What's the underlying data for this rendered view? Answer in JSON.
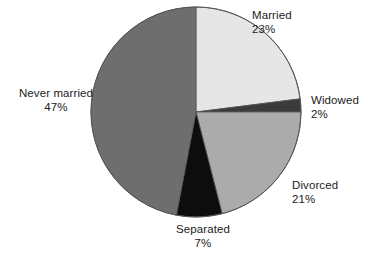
{
  "chart_data": {
    "type": "pie",
    "title": "",
    "subtitle": "",
    "xlabel": "",
    "ylabel": "",
    "legend_position": "none",
    "grid": false,
    "labels_outside": true,
    "start_angle_deg": 0,
    "direction": "clockwise",
    "categories": [
      "Married",
      "Widowed",
      "Divorced",
      "Separated",
      "Never married"
    ],
    "values": [
      23,
      2,
      21,
      7,
      47
    ],
    "unit": "%",
    "total": 100,
    "slices": [
      {
        "name": "Married",
        "value": 23,
        "value_text": "23%",
        "color": "#e6e6e6",
        "start_deg": 0,
        "end_deg": 82.8
      },
      {
        "name": "Widowed",
        "value": 2,
        "value_text": "2%",
        "color": "#3b3b3b",
        "start_deg": 82.8,
        "end_deg": 90.0
      },
      {
        "name": "Divorced",
        "value": 21,
        "value_text": "21%",
        "color": "#ababab",
        "start_deg": 90.0,
        "end_deg": 165.6
      },
      {
        "name": "Separated",
        "value": 7,
        "value_text": "7%",
        "color": "#0d0d0d",
        "start_deg": 165.6,
        "end_deg": 190.8
      },
      {
        "name": "Never married",
        "value": 47,
        "value_text": "47%",
        "color": "#6e6e6e",
        "start_deg": 190.8,
        "end_deg": 360.0
      }
    ]
  },
  "geometry": {
    "center_x": 196,
    "center_y": 112,
    "radius": 105
  },
  "colors": {
    "background": "#ffffff",
    "text": "#1c1c1c",
    "outline": "#555555",
    "married": "#e6e6e6",
    "widowed": "#3b3b3b",
    "divorced": "#ababab",
    "separated": "#0d0d0d",
    "never_married": "#6e6e6e"
  }
}
